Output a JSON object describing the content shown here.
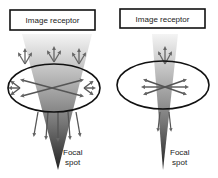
{
  "panels": [
    {
      "id": "left",
      "receptor_label": "Image receptor",
      "source_label_line1": "Focal",
      "source_label_line2": "spot",
      "description": "broad beam with many scatter arrows"
    },
    {
      "id": "right",
      "receptor_label": "Image receptor",
      "source_label_line1": "Focal",
      "source_label_line2": "spot",
      "description": "narrow beam with fewer scatter arrows"
    }
  ],
  "colors": {
    "beam_dark": "#333333",
    "beam_light": "#eeeeee",
    "arrow": "#666666",
    "outline": "#111111"
  }
}
